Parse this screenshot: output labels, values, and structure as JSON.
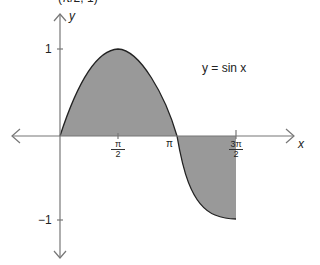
{
  "figure": {
    "top_cropped_text": "(π/2, 1)",
    "function_label": "y = sin x",
    "x_axis_label": "x",
    "y_axis_label": "y",
    "y_ticks": [
      {
        "value": 1,
        "label": "1"
      },
      {
        "value": -1,
        "label": "−1"
      }
    ],
    "x_ticks": [
      {
        "value": "π/2",
        "num": "π",
        "den": "2"
      },
      {
        "value": "π",
        "label": "π"
      },
      {
        "value": "3π/2",
        "num": "3π",
        "den": "2"
      }
    ],
    "shaded_region": "area between y = sin x and x-axis from 0 to 3π/2",
    "colors": {
      "fill": "#999999",
      "curve": "#222222",
      "axis": "#777777"
    }
  }
}
